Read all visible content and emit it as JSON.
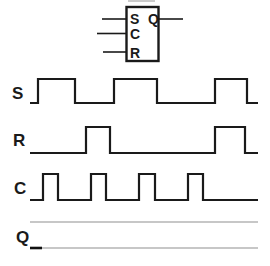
{
  "colors": {
    "ink": "#1a1a1a",
    "guide_gray": "#8f8f8f",
    "background": "#ffffff"
  },
  "flipflop": {
    "pin_labels": {
      "s": "S",
      "c": "C",
      "r": "R",
      "q": "Q"
    }
  },
  "waveforms": [
    {
      "label": "S",
      "x_start": 30,
      "x_end": 258,
      "y_high": 79,
      "y_low": 103,
      "initial": "low",
      "transitions": [
        38,
        75,
        114,
        157,
        215,
        247
      ]
    },
    {
      "label": "R",
      "x_start": 30,
      "x_end": 258,
      "y_high": 127,
      "y_low": 153,
      "initial": "low",
      "transitions": [
        86,
        110,
        215,
        245
      ]
    },
    {
      "label": "C",
      "x_start": 30,
      "x_end": 258,
      "y_high": 174,
      "y_low": 200,
      "initial": "low",
      "transitions": [
        43,
        58,
        91,
        106,
        139,
        155,
        188,
        203
      ]
    }
  ],
  "q_row": {
    "label": "Q",
    "x_start": 30,
    "x_end": 258,
    "guide_top_y": 222,
    "guide_bottom_y": 248,
    "initial_mark": {
      "x1": 30,
      "x2": 42,
      "y": 248
    }
  }
}
